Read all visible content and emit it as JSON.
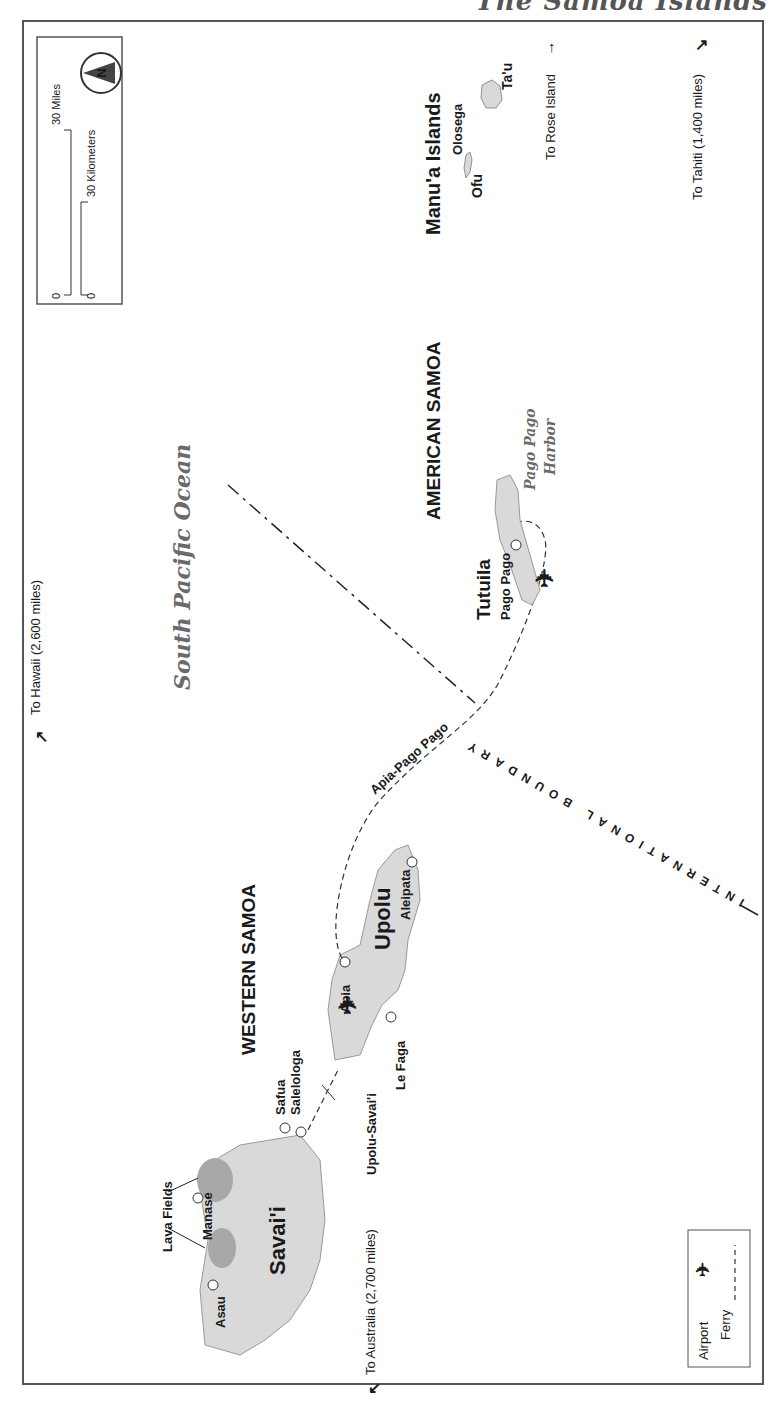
{
  "header": {
    "title_partial": "The Samoa Islands"
  },
  "compass": {
    "label": "N"
  },
  "scale": {
    "miles_label": "30 Miles",
    "miles_zero": "0",
    "km_label": "30 Kilometers",
    "km_zero": "0"
  },
  "legend": {
    "airport_label": "Airport",
    "ferry_label": "Ferry"
  },
  "regions": {
    "western_samoa": "WESTERN  SAMOA",
    "american_samoa": "AMERICAN  SAMOA",
    "ocean": "South Pacific Ocean",
    "boundary": "INTERNATIONAL BOUNDARY"
  },
  "islands": {
    "savaii": "Savai'i",
    "upolu": "Upolu",
    "tutuila": "Tutuila",
    "manua": "Manu'a Islands",
    "olosega": "Olosega",
    "ofu": "Ofu",
    "tau": "Ta'u"
  },
  "towns": {
    "asau": "Asau",
    "manase": "Manase",
    "lava_fields": "Lava Fields",
    "safua": "Safua",
    "salelologa": "Salelologa",
    "apia": "Apia",
    "le_faga": "Le Faga",
    "aleipata": "Aleipata",
    "pago_pago": "Pago Pago",
    "pago_pago_harbor_1": "Pago Pago",
    "pago_pago_harbor_2": "Harbor"
  },
  "routes": {
    "upolu_savaii": "Upolu-Savai'i",
    "apia_pago_pago": "Apia-Pago Pago"
  },
  "directions": {
    "hawaii": "To Hawaii (2,600 miles)",
    "australia": "To Australia (2,700 miles)",
    "tahiti": "To Tahiti (1,400 miles)",
    "rose_island": "To Rose Island"
  },
  "colors": {
    "land": "#d9d9d9",
    "lava": "#a8a8a8",
    "frame": "#555555"
  }
}
